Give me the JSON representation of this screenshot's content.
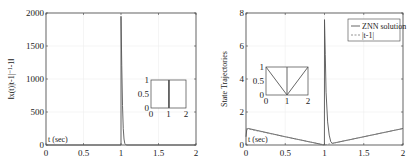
{
  "chart_data": [
    {
      "type": "line",
      "title": "",
      "xlabel": "",
      "ylabel": "||x(t)|t-1|^-1 - 1||",
      "ylabel_display": "‖x(t)|t-1|⁻¹-1‖",
      "annotation": "t (sec)",
      "xlim": [
        0,
        2
      ],
      "ylim": [
        0,
        2000
      ],
      "xticks": [
        "0",
        "0.5",
        "1",
        "1.5",
        "2"
      ],
      "yticks": [
        "0",
        "500",
        "1000",
        "1500",
        "2000"
      ],
      "grid": true,
      "series": [
        {
          "name": "residual error",
          "color": "#555555",
          "x": [
            0,
            0.999,
            1.0,
            1.0,
            1.01,
            1.02,
            1.03,
            1.04,
            1.05,
            1.07,
            2.0
          ],
          "y": [
            0,
            0,
            0,
            1950,
            1200,
            600,
            250,
            90,
            25,
            0,
            0
          ]
        }
      ],
      "inset": {
        "xlim": [
          0,
          2
        ],
        "ylim": [
          0,
          1
        ],
        "xticks": [
          "0",
          "1",
          "2"
        ],
        "yticks": [
          "0",
          "0.5",
          "1"
        ],
        "series": [
          {
            "x": [
              1.0,
              1.0
            ],
            "y": [
              0,
              1
            ]
          },
          {
            "x": [
              1.05,
              1.05
            ],
            "y": [
              0,
              1
            ]
          }
        ]
      }
    },
    {
      "type": "line",
      "title": "",
      "xlabel": "",
      "ylabel": "State Trajectories",
      "annotation": "t (sec)",
      "xlim": [
        0,
        2
      ],
      "ylim": [
        0,
        8
      ],
      "xticks": [
        "0",
        "0.5",
        "1",
        "1.5",
        "2"
      ],
      "yticks": [
        "0",
        "2",
        "4",
        "6",
        "8"
      ],
      "grid": true,
      "legend": {
        "position": "upper right",
        "entries": [
          "ZNN solution",
          "|t-1|"
        ]
      },
      "series": [
        {
          "name": "ZNN solution",
          "color": "#555555",
          "style": "solid",
          "x": [
            0,
            0.01,
            0.03,
            0.5,
            0.999,
            1.0,
            1.01,
            1.02,
            1.04,
            1.06,
            1.08,
            1.1,
            1.5,
            2.0
          ],
          "y": [
            0.5,
            0.95,
            1.0,
            0.5,
            0.0,
            7.6,
            5.5,
            3.2,
            1.4,
            0.6,
            0.2,
            0.1,
            0.5,
            1.0
          ]
        },
        {
          "name": "|t-1|",
          "color": "#888888",
          "style": "dashed",
          "x": [
            0,
            1,
            2
          ],
          "y": [
            1,
            0,
            1
          ]
        }
      ],
      "inset": {
        "xlim": [
          0,
          2
        ],
        "ylim": [
          0,
          1
        ],
        "xticks": [
          "0",
          "1",
          "2"
        ],
        "yticks": [
          "0",
          "0.5",
          "1"
        ],
        "series": [
          {
            "x": [
              0,
              1,
              2
            ],
            "y": [
              1,
              0,
              1
            ]
          },
          {
            "x": [
              1,
              1
            ],
            "y": [
              0,
              1
            ]
          }
        ]
      }
    }
  ]
}
